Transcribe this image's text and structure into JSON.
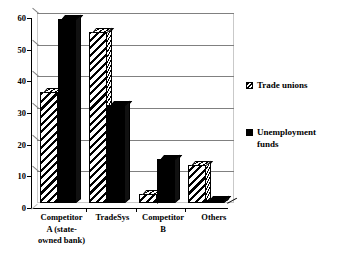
{
  "chart_data": {
    "type": "bar",
    "title": "",
    "subtitle": "",
    "xlabel": "",
    "ylabel": "",
    "ylim": [
      0,
      60
    ],
    "yticks": [
      0,
      10,
      20,
      30,
      40,
      50,
      60
    ],
    "ytick_labels": [
      "0",
      "10",
      "20",
      "30",
      "40",
      "50",
      "60"
    ],
    "grid": true,
    "grid_axis": "y",
    "legend_position": "right",
    "categories": [
      "Competitor\nA (state-\nowned bank)",
      "TradeSys",
      "Competitor\nB",
      "Others"
    ],
    "category_labels_flat": [
      "Competitor A (state-owned bank)",
      "TradeSys",
      "Competitor B",
      "Others"
    ],
    "series": [
      {
        "name": "Trade unions",
        "fill": "diagonal-hatch",
        "color": "#ffffff",
        "values": [
          35,
          54,
          3,
          12
        ]
      },
      {
        "name": "Unemployment funds",
        "fill": "solid",
        "color": "#000000",
        "values": [
          58,
          31,
          14,
          1
        ]
      }
    ]
  },
  "legend": {
    "items": [
      {
        "label": "Trade unions",
        "swatch": "hatched-swatch-icon"
      },
      {
        "label": "Unemployment\nfunds",
        "swatch": "solid-swatch-icon"
      }
    ]
  },
  "colors": {
    "axis": "#000000",
    "gridline": "#808080",
    "frame": "#c9c9c9",
    "background": "#ffffff",
    "series_solid": "#000000",
    "series_hatch_bg": "#ffffff"
  }
}
